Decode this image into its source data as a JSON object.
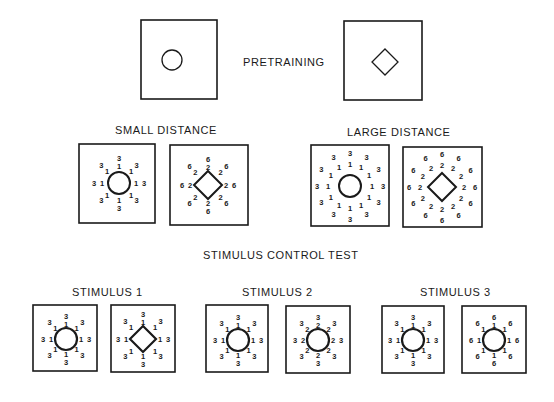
{
  "labels": {
    "pretraining": "PRETRAINING",
    "small_distance": "SMALL  DISTANCE",
    "large_distance": "LARGE  DISTANCE",
    "stimulus_control_test": "STIMULUS  CONTROL  TEST",
    "stimulus_1": "STIMULUS  1",
    "stimulus_2": "STIMULUS  2",
    "stimulus_3": "STIMULUS  3"
  },
  "colors": {
    "ink": "#1a1a1a",
    "background": "#ffffff"
  },
  "panels": [
    {
      "id": "pretraining-circle",
      "group": "pretraining",
      "box": [
        141,
        20,
        76,
        79
      ],
      "shape": "circle",
      "center": [
        172,
        60
      ],
      "size": 10,
      "stroke": 1.3,
      "rings": []
    },
    {
      "id": "pretraining-diamond",
      "group": "pretraining",
      "box": [
        344,
        21,
        78,
        79
      ],
      "shape": "diamond",
      "center": [
        385,
        62
      ],
      "size": 13,
      "stroke": 1.3,
      "rings": []
    },
    {
      "id": "small-distance-circle",
      "group": "small-distance",
      "box": [
        79,
        144,
        76,
        79
      ],
      "shape": "circle",
      "center": [
        119,
        183
      ],
      "size": 11,
      "stroke": 2,
      "rings": [
        {
          "r": 17,
          "count": 8,
          "value": "1"
        },
        {
          "r": 25,
          "count": 8,
          "value": "3"
        }
      ]
    },
    {
      "id": "small-distance-diamond",
      "group": "small-distance",
      "box": [
        170,
        145,
        78,
        80
      ],
      "shape": "diamond",
      "center": [
        208,
        185
      ],
      "size": 14,
      "stroke": 2,
      "rings": [
        {
          "r": 18,
          "count": 8,
          "value": "2"
        },
        {
          "r": 26,
          "count": 8,
          "value": "6"
        }
      ]
    },
    {
      "id": "large-distance-circle",
      "group": "large-distance",
      "box": [
        311,
        145,
        78,
        81
      ],
      "shape": "circle",
      "center": [
        350,
        186
      ],
      "size": 11,
      "stroke": 2,
      "rings": [
        {
          "r": 22,
          "count": 12,
          "value": "1"
        },
        {
          "r": 33,
          "count": 12,
          "value": "3"
        }
      ]
    },
    {
      "id": "large-distance-diamond",
      "group": "large-distance",
      "box": [
        403,
        147,
        79,
        80
      ],
      "shape": "diamond",
      "center": [
        442,
        187
      ],
      "size": 14,
      "stroke": 2,
      "rings": [
        {
          "r": 22,
          "count": 12,
          "value": "2"
        },
        {
          "r": 33,
          "count": 12,
          "value": "6"
        }
      ]
    },
    {
      "id": "stimulus-1-circle",
      "group": "stimulus-1",
      "box": [
        33,
        305,
        64,
        66
      ],
      "shape": "circle",
      "center": [
        66,
        339
      ],
      "size": 11,
      "stroke": 2.2,
      "rings": [
        {
          "r": 15,
          "count": 8,
          "value": "1"
        },
        {
          "r": 23,
          "count": 8,
          "value": "3"
        }
      ]
    },
    {
      "id": "stimulus-1-diamond",
      "group": "stimulus-1",
      "box": [
        111,
        305,
        64,
        67
      ],
      "shape": "diamond",
      "center": [
        143,
        339
      ],
      "size": 13,
      "stroke": 2.2,
      "rings": [
        {
          "r": 17,
          "count": 8,
          "value": "1"
        },
        {
          "r": 25,
          "count": 8,
          "value": "3"
        }
      ]
    },
    {
      "id": "stimulus-2-circle",
      "group": "stimulus-2",
      "box": [
        206,
        305,
        62,
        67
      ],
      "shape": "circle",
      "center": [
        238,
        340
      ],
      "size": 11,
      "stroke": 2.2,
      "rings": [
        {
          "r": 15,
          "count": 8,
          "value": "1"
        },
        {
          "r": 23,
          "count": 8,
          "value": "3"
        }
      ]
    },
    {
      "id": "stimulus-2-circle-b",
      "group": "stimulus-2",
      "box": [
        286,
        306,
        64,
        67
      ],
      "shape": "circle",
      "center": [
        318,
        340
      ],
      "size": 11,
      "stroke": 2.2,
      "rings": [
        {
          "r": 15,
          "count": 8,
          "value": "2"
        },
        {
          "r": 23,
          "count": 8,
          "value": "3"
        }
      ]
    },
    {
      "id": "stimulus-3-circle",
      "group": "stimulus-3",
      "box": [
        382,
        306,
        62,
        67
      ],
      "shape": "circle",
      "center": [
        413,
        340
      ],
      "size": 11,
      "stroke": 2.2,
      "rings": [
        {
          "r": 15,
          "count": 8,
          "value": "1"
        },
        {
          "r": 23,
          "count": 8,
          "value": "3"
        }
      ]
    },
    {
      "id": "stimulus-3-circle-b",
      "group": "stimulus-3",
      "box": [
        462,
        306,
        64,
        67
      ],
      "shape": "circle",
      "center": [
        494,
        340
      ],
      "size": 11,
      "stroke": 2.2,
      "rings": [
        {
          "r": 15,
          "count": 8,
          "value": "1"
        },
        {
          "r": 23,
          "count": 8,
          "value": "6"
        }
      ]
    }
  ]
}
